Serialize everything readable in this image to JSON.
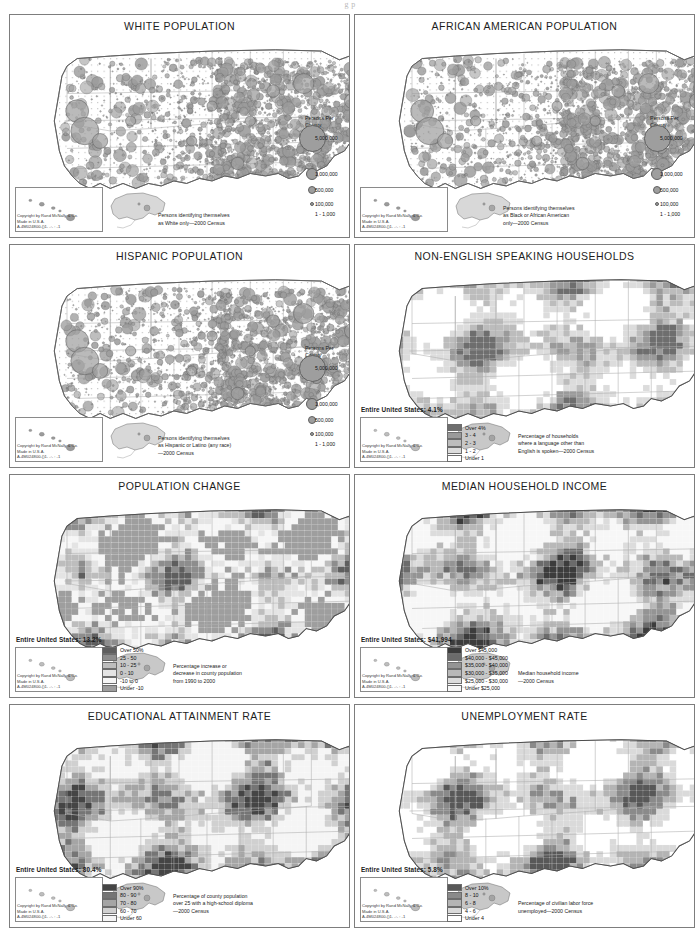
{
  "page": {
    "header_fragment": "g p",
    "copyright": "Copyright by Rand McNally & Co.\nMade in U.S.A.\nA-4M024800-()1- -:- : -1"
  },
  "legend_titles": {
    "persons_per_county": "Persons Per\nCounty"
  },
  "panels": [
    {
      "id": "white-population",
      "title": "WHITE POPULATION",
      "type": "proportional-symbol",
      "note": "Persons identifying themselves\nas White only—2000 Census",
      "circle_legend": {
        "title": "Persons Per\nCounty",
        "items": [
          {
            "label": "5,000,000",
            "r": 13.5
          },
          {
            "label": "1,000,000",
            "r": 6.2
          },
          {
            "label": "500,000",
            "r": 4.4
          },
          {
            "label": "100,000",
            "r": 2.2
          },
          {
            "label": "1 - 1,000",
            "r": 0
          }
        ]
      }
    },
    {
      "id": "african-american-population",
      "title": "AFRICAN AMERICAN POPULATION",
      "type": "proportional-symbol",
      "note": "Persons identifying themselves\nas Black or African American\nonly—2000 Census",
      "circle_legend": {
        "title": "Persons Per\nCounty",
        "items": [
          {
            "label": "5,000,000",
            "r": 13.5
          },
          {
            "label": "1,000,000",
            "r": 6.2
          },
          {
            "label": "500,000",
            "r": 4.4
          },
          {
            "label": "100,000",
            "r": 2.2
          },
          {
            "label": "1 - 1,000",
            "r": 0
          }
        ]
      }
    },
    {
      "id": "hispanic-population",
      "title": "HISPANIC POPULATION",
      "type": "proportional-symbol",
      "note": "Persons identifying themselves\nas Hispanic or Latino (any race)\n—2000 Census",
      "circle_legend": {
        "title": "Persons Per\nCounty",
        "items": [
          {
            "label": "5,000,000",
            "r": 13.5
          },
          {
            "label": "1,000,000",
            "r": 6.2
          },
          {
            "label": "500,000",
            "r": 4.4
          },
          {
            "label": "100,000",
            "r": 2.2
          },
          {
            "label": "1 - 1,000",
            "r": 0
          }
        ]
      }
    },
    {
      "id": "non-english-speaking-households",
      "title": "NON-ENGLISH SPEAKING HOUSEHOLDS",
      "type": "choropleth",
      "us_stat": "Entire United States: 4.1%",
      "note": "Percentage of households\nwhere a language other than\nEnglish is spoken—2000 Census",
      "classes": [
        {
          "label": "Over 4%",
          "color": "#6e6e6e"
        },
        {
          "label": "3 - 4",
          "color": "#9a9a9a"
        },
        {
          "label": "2 - 3",
          "color": "#bcbcbc"
        },
        {
          "label": "1 - 2",
          "color": "#dcdcdc"
        },
        {
          "label": "Under 1",
          "color": "#ffffff"
        }
      ]
    },
    {
      "id": "population-change",
      "title": "POPULATION CHANGE",
      "type": "choropleth",
      "us_stat": "Entire United States: 13.2%",
      "note": "Percentage increase or\ndecrease in county population\nfrom 1990 to 2000",
      "classes": [
        {
          "label": "Over 50%",
          "color": "#5e5e5e"
        },
        {
          "label": "25 - 50",
          "color": "#8d8d8d"
        },
        {
          "label": "10 - 25",
          "color": "#bdbdbd"
        },
        {
          "label": "0 - 10",
          "color": "#e4e4e4"
        },
        {
          "label": "-10 to 0",
          "color": "#f6f6f6"
        },
        {
          "label": "Under -10",
          "color": "#9e9e9e"
        }
      ]
    },
    {
      "id": "median-household-income",
      "title": "MEDIAN HOUSEHOLD INCOME",
      "type": "choropleth",
      "us_stat": "Entire United States: $41,994",
      "note": "Median household income\n—2000 Census",
      "classes": [
        {
          "label": "Over $45,000",
          "color": "#3c3c3c"
        },
        {
          "label": "$40,000 - $45,000",
          "color": "#6b6b6b"
        },
        {
          "label": "$35,000 - $40,000",
          "color": "#949494"
        },
        {
          "label": "$30,000 - $35,000",
          "color": "#b8b8b8"
        },
        {
          "label": "$25,000 - $30,000",
          "color": "#dcdcdc"
        },
        {
          "label": "Under $25,000",
          "color": "#f7f7f7"
        }
      ]
    },
    {
      "id": "educational-attainment-rate",
      "title": "EDUCATIONAL ATTAINMENT RATE",
      "type": "choropleth",
      "us_stat": "Entire United States: 80.4%",
      "note": "Percentage of county population\nover 25 with a high-school diploma\n—2000 Census",
      "classes": [
        {
          "label": "Over 90%",
          "color": "#454545"
        },
        {
          "label": "80 - 90",
          "color": "#757575"
        },
        {
          "label": "70 - 80",
          "color": "#a5a5a5"
        },
        {
          "label": "60 - 70",
          "color": "#d0d0d0"
        },
        {
          "label": "Under 60",
          "color": "#f5f5f5"
        }
      ]
    },
    {
      "id": "unemployment-rate",
      "title": "UNEMPLOYMENT RATE",
      "type": "choropleth",
      "us_stat": "Entire United States: 5.8%",
      "note": "Percentage of civilian labor force\nunemployed—2000 Census",
      "classes": [
        {
          "label": "Over 10%",
          "color": "#585858"
        },
        {
          "label": "8 - 10",
          "color": "#8a8a8a"
        },
        {
          "label": "6 - 8",
          "color": "#b4b4b4"
        },
        {
          "label": "4 - 6",
          "color": "#dadada"
        },
        {
          "label": "Under 4",
          "color": "#ffffff"
        }
      ]
    }
  ],
  "chart_data": {
    "type": "map",
    "maps": [
      {
        "name": "WHITE POPULATION",
        "measure": "Persons per county",
        "symbology": "proportional circles",
        "breaks": [
          "5,000,000",
          "1,000,000",
          "500,000",
          "100,000",
          "1 - 1,000"
        ]
      },
      {
        "name": "AFRICAN AMERICAN POPULATION",
        "measure": "Persons per county",
        "symbology": "proportional circles",
        "breaks": [
          "5,000,000",
          "1,000,000",
          "500,000",
          "100,000",
          "1 - 1,000"
        ]
      },
      {
        "name": "HISPANIC POPULATION",
        "measure": "Persons per county",
        "symbology": "proportional circles",
        "breaks": [
          "5,000,000",
          "1,000,000",
          "500,000",
          "100,000",
          "1 - 1,000"
        ]
      },
      {
        "name": "NON-ENGLISH SPEAKING HOUSEHOLDS",
        "measure": "% households speaking a language other than English",
        "us_value": "4.1%",
        "breaks": [
          "Over 4%",
          "3 - 4",
          "2 - 3",
          "1 - 2",
          "Under 1"
        ]
      },
      {
        "name": "POPULATION CHANGE",
        "measure": "% change in county population 1990-2000",
        "us_value": "13.2%",
        "breaks": [
          "Over 50%",
          "25 - 50",
          "10 - 25",
          "0 - 10",
          "-10 to 0",
          "Under -10"
        ]
      },
      {
        "name": "MEDIAN HOUSEHOLD INCOME",
        "measure": "Median household income",
        "us_value": "$41,994",
        "breaks": [
          "Over $45,000",
          "$40,000 - $45,000",
          "$35,000 - $40,000",
          "$30,000 - $35,000",
          "$25,000 - $30,000",
          "Under $25,000"
        ]
      },
      {
        "name": "EDUCATIONAL ATTAINMENT RATE",
        "measure": "% of population over 25 with a high-school diploma",
        "us_value": "80.4%",
        "breaks": [
          "Over 90%",
          "80 - 90",
          "70 - 80",
          "60 - 70",
          "Under 60"
        ]
      },
      {
        "name": "UNEMPLOYMENT RATE",
        "measure": "% of civilian labor force unemployed",
        "us_value": "5.8%",
        "breaks": [
          "Over 10%",
          "8 - 10",
          "6 - 8",
          "4 - 6",
          "Under 4"
        ]
      }
    ]
  }
}
